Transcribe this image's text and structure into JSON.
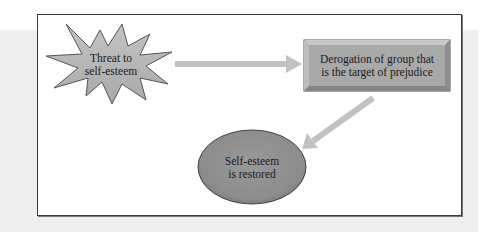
{
  "diagram": {
    "nodes": {
      "threat": {
        "shape": "starburst",
        "lines": [
          "Threat to",
          "self-esteem"
        ],
        "fill": "#b3b3b3"
      },
      "derogation": {
        "shape": "bevel-rectangle",
        "lines": [
          "Derogation of group that",
          "is the target of prejudice"
        ],
        "fill": "#a9a9a9"
      },
      "restored": {
        "shape": "ellipse",
        "lines": [
          "Self-esteem",
          "is restored"
        ],
        "fill": "#8f8f8f"
      }
    },
    "edges": [
      {
        "from": "threat",
        "to": "derogation",
        "direction": "right"
      },
      {
        "from": "derogation",
        "to": "restored",
        "direction": "down-left"
      }
    ],
    "colors": {
      "arrow": "#c2c2c2",
      "frame_border": "#3a3a3a",
      "background_band": "#efefef"
    }
  }
}
